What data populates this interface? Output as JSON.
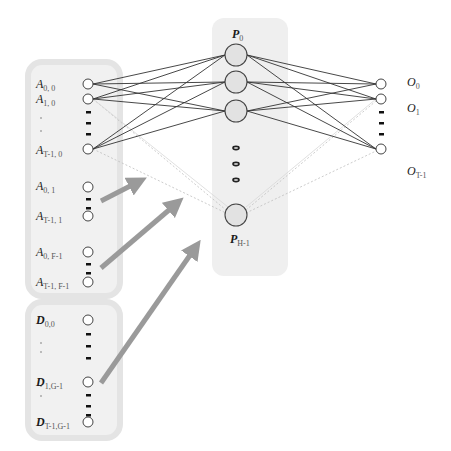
{
  "colors": {
    "panel_fill": "#ececec",
    "panel_stroke": "#e2e2e2",
    "hidden_column": "#efefef",
    "hidden_node_fill": "#e4e4e4",
    "node_stroke": "#444444",
    "solid_edge": "#333333",
    "faint_edge": "#bbbbbb",
    "arrow": "#999999"
  },
  "input_group_A": {
    "nodes": [
      {
        "label": "A",
        "sub": "0, 0",
        "y": 84
      },
      {
        "label": "A",
        "sub": "1, 0",
        "y": 99
      },
      {
        "label": "A",
        "sub": "T-1, 0",
        "y": 149
      },
      {
        "label": "A",
        "sub": "0, 1",
        "y": 187
      },
      {
        "label": "A",
        "sub": "T-1, 1",
        "y": 216
      },
      {
        "label": "A",
        "sub": "0, F-1",
        "y": 252
      },
      {
        "label": "A",
        "sub": "T-1, F-1",
        "y": 282
      }
    ]
  },
  "input_group_D": {
    "nodes": [
      {
        "label": "D",
        "sub": "0,0",
        "y": 320
      },
      {
        "label": "D",
        "sub": "1,G-1",
        "y": 382
      },
      {
        "label": "D",
        "sub": "T-1,G-1",
        "y": 422
      }
    ]
  },
  "hidden_layer": {
    "top_label": {
      "label": "P",
      "sub": "0"
    },
    "bottom_label": {
      "label": "P",
      "sub": "H-1"
    },
    "nodes_y": [
      55,
      82,
      111,
      215
    ]
  },
  "output_layer": {
    "nodes": [
      {
        "label": "O",
        "sub": "0",
        "y": 84,
        "label_y": 80
      },
      {
        "label": "O",
        "sub": "1",
        "y": 99,
        "label_y": 108
      },
      {
        "label": "O",
        "sub": "T-1",
        "y": 149,
        "label_y": 171
      }
    ]
  }
}
